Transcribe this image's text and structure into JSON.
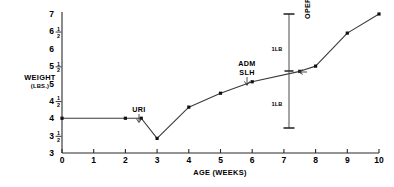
{
  "chart_data": {
    "type": "line",
    "title": "",
    "xlabel": "AGE (WEEKS)",
    "ylabel": "WEIGHT",
    "ylabel_units": "(LBS.)",
    "xlim": [
      0,
      10
    ],
    "ylim": [
      3,
      7
    ],
    "grid": false,
    "legend": null,
    "x_ticks": [
      "0",
      "1",
      "2",
      "3",
      "4",
      "5",
      "6",
      "7",
      "8",
      "9",
      "10"
    ],
    "x_tick_values": [
      0,
      1,
      2,
      3,
      4,
      5,
      6,
      7,
      8,
      9,
      10
    ],
    "y_ticks": [
      "3",
      "3 1/2",
      "4",
      "4 1/2",
      "5",
      "5 1/2",
      "6",
      "6 1/2",
      "7"
    ],
    "y_tick_values": [
      3,
      3.5,
      4,
      4.5,
      5,
      5.5,
      6,
      6.5,
      7
    ],
    "y_tick_display": [
      {
        "whole": "3",
        "num": "",
        "den": ""
      },
      {
        "whole": "3",
        "num": "1",
        "den": "2"
      },
      {
        "whole": "4",
        "num": "",
        "den": ""
      },
      {
        "whole": "4",
        "num": "1",
        "den": "2"
      },
      {
        "whole": "5",
        "num": "",
        "den": ""
      },
      {
        "whole": "5",
        "num": "1",
        "den": "2"
      },
      {
        "whole": "6",
        "num": "",
        "den": ""
      },
      {
        "whole": "6",
        "num": "1",
        "den": "2"
      },
      {
        "whole": "7",
        "num": "",
        "den": ""
      }
    ],
    "series": [
      {
        "name": "weight",
        "x": [
          0,
          2,
          2.5,
          3,
          4,
          5,
          6,
          7.5,
          8,
          9,
          10
        ],
        "values": [
          4.0,
          4.0,
          4.0,
          3.42,
          4.32,
          4.72,
          5.05,
          5.35,
          5.5,
          6.45,
          7.0
        ]
      }
    ],
    "annotations": [
      {
        "id": "uri",
        "label": "URI",
        "x": 2.5,
        "y": 4.0,
        "kind": "arrow-down"
      },
      {
        "id": "adm-slh",
        "label": "ADM",
        "label2": "SLH",
        "x": 6.0,
        "y": 5.05,
        "kind": "arrow-down"
      },
      {
        "id": "operation",
        "label": "OPERATION",
        "x": 8.0,
        "y": 5.5,
        "kind": "arrow-left-rotated"
      },
      {
        "id": "gain-1lb",
        "label": "1LB",
        "x": 7.5,
        "y_from": 5.35,
        "y_to": 7.0,
        "kind": "measure-bar"
      },
      {
        "id": "loss-1lb",
        "label": "1LB",
        "x": 7.5,
        "y_from": 3.6,
        "y_to": 5.35,
        "kind": "measure-bar"
      }
    ]
  },
  "axis": {
    "y_title": "WEIGHT",
    "y_subtitle": "(LBS.)",
    "x_title": "AGE (WEEKS)"
  },
  "annotations": {
    "uri": "URI",
    "adm": "ADM",
    "slh": "SLH",
    "operation": "OPERATION",
    "measure_upper": "1LB",
    "measure_lower": "1LB"
  },
  "colors": {
    "ink": "#111111",
    "line": "#3a3a3a",
    "axis": "#2b2b2b",
    "background": "#ffffff"
  }
}
